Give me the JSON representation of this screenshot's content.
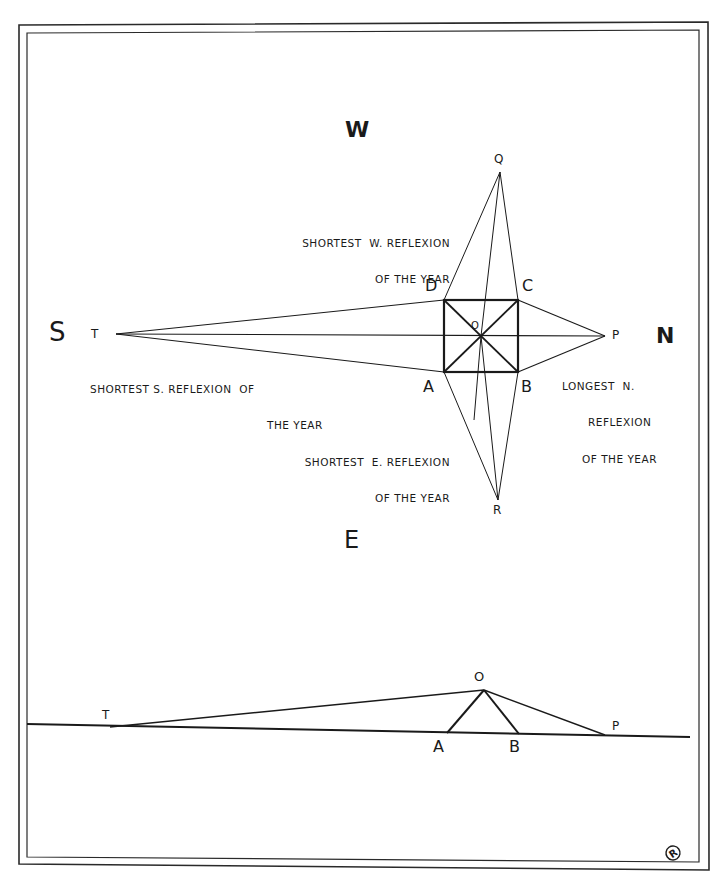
{
  "figure": {
    "compass": {
      "west": "W",
      "south": "S",
      "north": "N",
      "east": "E"
    },
    "plan": {
      "corners": {
        "a": "A",
        "b": "B",
        "c": "C",
        "d": "D"
      },
      "center": "O",
      "points": {
        "t": "T",
        "p": "P",
        "q": "Q",
        "r": "R"
      },
      "annotations": {
        "shortest_w_line1": "SHORTEST  W. REFLEXION",
        "shortest_w_line2": "OF THE YEAR",
        "shortest_s_line1": "SHORTEST S. REFLEXION  OF",
        "shortest_s_line2": "THE YEAR",
        "longest_n_line1": "LONGEST  N.",
        "longest_n_line2": "REFLEXION",
        "longest_n_line3": "OF THE YEAR",
        "shortest_e_line1": "SHORTEST  E. REFLEXION",
        "shortest_e_line2": "OF THE YEAR"
      }
    },
    "elevation": {
      "points": {
        "t": "T",
        "o": "O",
        "a": "A",
        "b": "B",
        "p": "P"
      }
    },
    "colors": {
      "ink": "#1a1a1a",
      "paper": "#ffffff"
    }
  }
}
